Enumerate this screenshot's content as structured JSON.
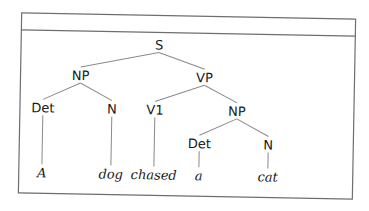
{
  "figure": {
    "header_caption": "",
    "tree": {
      "nodes": [
        {
          "id": "S",
          "label": "S",
          "type": "category",
          "parent": null
        },
        {
          "id": "NP1",
          "label": "NP",
          "type": "category",
          "parent": "S"
        },
        {
          "id": "VP",
          "label": "VP",
          "type": "category",
          "parent": "S"
        },
        {
          "id": "Det1",
          "label": "Det",
          "type": "category",
          "parent": "NP1"
        },
        {
          "id": "N1",
          "label": "N",
          "type": "category",
          "parent": "NP1"
        },
        {
          "id": "V1",
          "label": "V1",
          "type": "category",
          "parent": "VP"
        },
        {
          "id": "NP2",
          "label": "NP",
          "type": "category",
          "parent": "VP"
        },
        {
          "id": "Det2",
          "label": "Det",
          "type": "category",
          "parent": "NP2"
        },
        {
          "id": "N2",
          "label": "N",
          "type": "category",
          "parent": "NP2"
        },
        {
          "id": "w1",
          "label": "A",
          "type": "word",
          "parent": "Det1"
        },
        {
          "id": "w2",
          "label": "dog",
          "type": "word",
          "parent": "N1"
        },
        {
          "id": "w3",
          "label": "chased",
          "type": "word",
          "parent": "V1"
        },
        {
          "id": "w4",
          "label": "a",
          "type": "word",
          "parent": "Det2"
        },
        {
          "id": "w5",
          "label": "cat",
          "type": "word",
          "parent": "N2"
        }
      ]
    }
  }
}
